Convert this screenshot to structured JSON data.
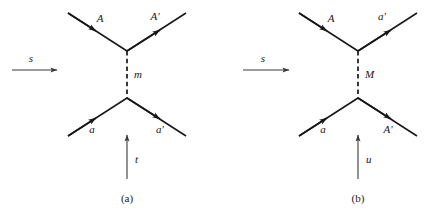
{
  "figure": {
    "type": "feynman-diagram-pair",
    "background_color": "#ffffff",
    "ink_color": "#171717",
    "panels": [
      {
        "id": "a",
        "caption": "(a)",
        "channel_arrow": {
          "label": "s",
          "direction": "right"
        },
        "exchange": {
          "label": "m",
          "style": "dashed",
          "orientation": "vertical"
        },
        "vertical_arrow": {
          "label": "t",
          "direction": "up"
        },
        "legs": [
          {
            "name": "top-left-leg",
            "label": "A",
            "arrow_direction": "in-toward-vertex"
          },
          {
            "name": "top-right-leg",
            "label": "A'",
            "arrow_direction": "out-from-vertex"
          },
          {
            "name": "bottom-left-leg",
            "label": "a",
            "arrow_direction": "in-toward-vertex"
          },
          {
            "name": "bottom-right-leg",
            "label": "a'",
            "arrow_direction": "out-from-vertex"
          }
        ]
      },
      {
        "id": "b",
        "caption": "(b)",
        "channel_arrow": {
          "label": "s",
          "direction": "right"
        },
        "exchange": {
          "label": "M",
          "style": "dashed",
          "orientation": "vertical"
        },
        "vertical_arrow": {
          "label": "u",
          "direction": "up"
        },
        "legs": [
          {
            "name": "top-left-leg",
            "label": "A",
            "arrow_direction": "in-toward-vertex"
          },
          {
            "name": "top-right-leg",
            "label": "a'",
            "arrow_direction": "out-from-vertex"
          },
          {
            "name": "bottom-left-leg",
            "label": "a",
            "arrow_direction": "in-toward-vertex"
          },
          {
            "name": "bottom-right-leg",
            "label": "A'",
            "arrow_direction": "out-from-vertex"
          }
        ]
      }
    ]
  }
}
